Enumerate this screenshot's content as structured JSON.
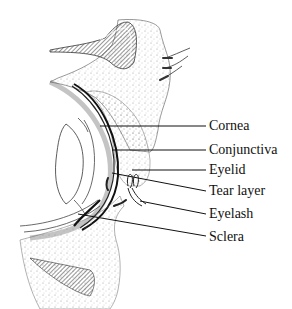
{
  "diagram": {
    "labels": [
      {
        "text": "Cornea",
        "x": 209,
        "y": 118,
        "leader_from": [
          100,
          126
        ],
        "leader_to": [
          206,
          126
        ]
      },
      {
        "text": "Conjunctiva",
        "x": 209,
        "y": 142,
        "leader_from": [
          112,
          150
        ],
        "leader_to": [
          206,
          150
        ]
      },
      {
        "text": "Eyelid",
        "x": 209,
        "y": 162,
        "leader_from": [
          132,
          170
        ],
        "leader_to": [
          206,
          170
        ]
      },
      {
        "text": "Tear layer",
        "x": 209,
        "y": 183,
        "leader_from": [
          112,
          173
        ],
        "leader_to": [
          206,
          191
        ]
      },
      {
        "text": "Eyelash",
        "x": 209,
        "y": 206,
        "leader_from": [
          140,
          201
        ],
        "leader_to": [
          206,
          214
        ]
      },
      {
        "text": "Sclera",
        "x": 209,
        "y": 229,
        "leader_from": [
          78,
          214
        ],
        "leader_to": [
          206,
          236
        ]
      }
    ],
    "colors": {
      "ink": "#111111",
      "stipple": "#9a9a9a",
      "background": "#ffffff"
    }
  }
}
